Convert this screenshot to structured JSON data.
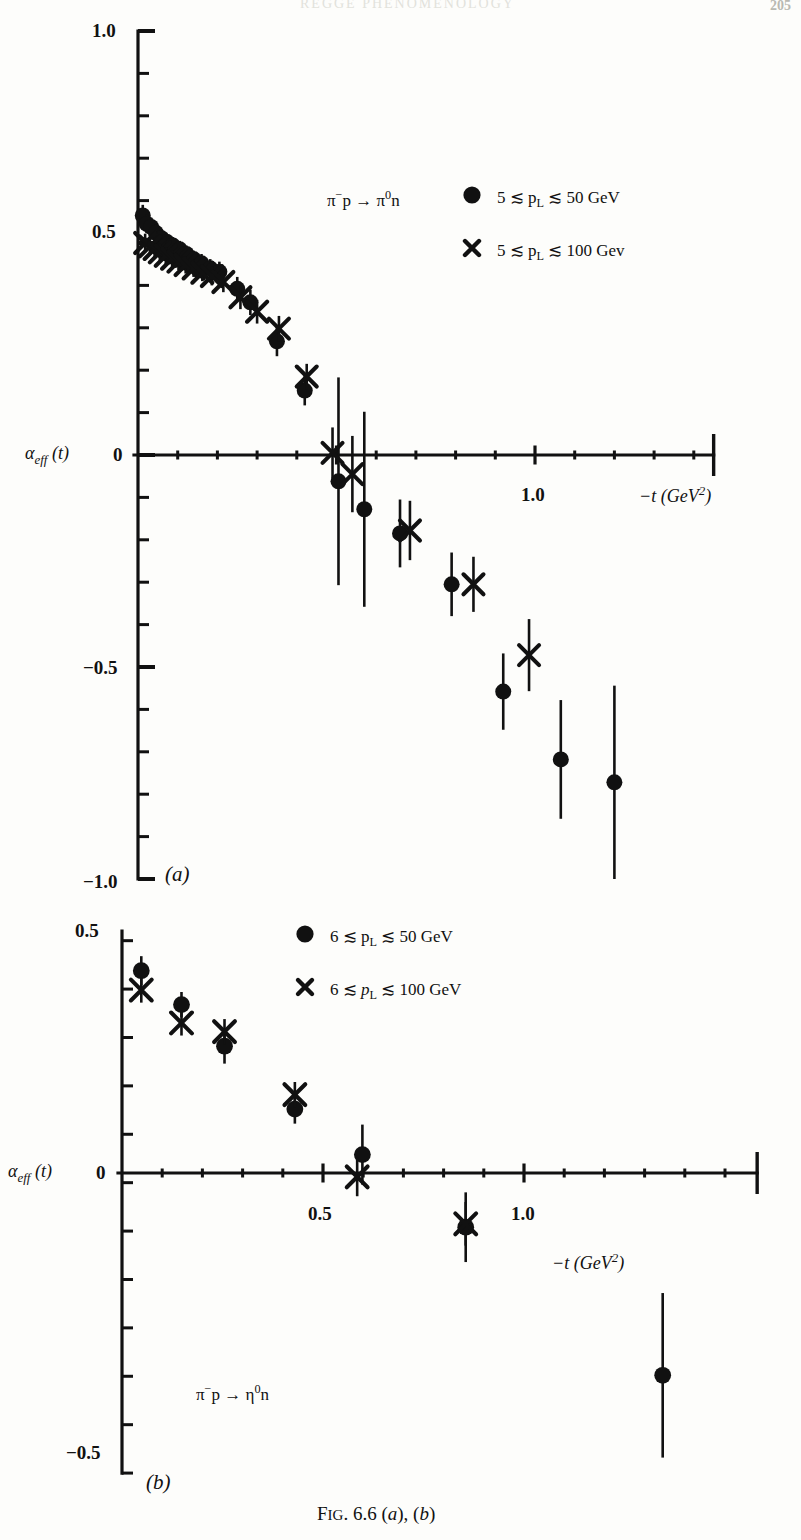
{
  "caption": "FIG. 6.6 (a), (b)",
  "axis_name_html": "&alpha;<sub><i>eff</i></sub> (<i>t</i>)",
  "xaxis_name_html": "&minus;<i>t</i> (GeV<sup>2</sup>)",
  "panel_a": {
    "id": "(a)",
    "reaction_html": "&pi;<sup>&minus;</sup>p &rarr; &pi;<sup>0</sup>n",
    "legend": [
      {
        "marker": "circle",
        "label_html": "5 &#8818; p<sub>L</sub> &#8818; 50 GeV"
      },
      {
        "marker": "cross",
        "label_html": "5 &#8818; p<sub>L</sub> &#8818; 100 Gev"
      }
    ],
    "ylabels": [
      "1.0",
      "0.5",
      "0",
      "-0.5",
      "-1.0"
    ],
    "xlabels": [
      "1.0"
    ]
  },
  "panel_b": {
    "id": "(b)",
    "reaction_html": "&pi;<sup>&minus;</sup>p &rarr; &eta;<sup>0</sup>n",
    "legend": [
      {
        "marker": "circle",
        "label_html": "6 &#8818; p<sub>L</sub> &#8818; 50 GeV"
      },
      {
        "marker": "cross",
        "label_html": "6 &#8818; <i>p</i><sub>L</sub> &#8818; 100 GeV"
      }
    ],
    "ylabels": [
      "0.5",
      "0",
      "-0.5"
    ],
    "xlabels": [
      "0.5",
      "1.0"
    ]
  },
  "chart_data": [
    {
      "type": "scatter",
      "panel": "(a)",
      "title": "pi- p -> pi0 n effective Regge trajectory",
      "xlabel": "-t (GeV^2)",
      "ylabel": "alpha_eff(t)",
      "xlim": [
        0.0,
        1.48
      ],
      "ylim": [
        -1.0,
        1.0
      ],
      "xticks_major": [
        0.5,
        1.0
      ],
      "xticks_major_labeled": [
        1.0
      ],
      "xtick_minor_step": 0.1,
      "yticks_major": [
        -1.0,
        -0.5,
        0.0,
        0.5,
        1.0
      ],
      "ytick_minor_step": 0.1,
      "grid": false,
      "legend_position": "upper-right",
      "series": [
        {
          "name": "5 <~ pL <~ 50 GeV",
          "marker": "filled-circle",
          "points": [
            {
              "x": 0.012,
              "y": 0.565,
              "yerr": 0.025
            },
            {
              "x": 0.022,
              "y": 0.545,
              "yerr": 0.022
            },
            {
              "x": 0.033,
              "y": 0.538,
              "yerr": 0.022
            },
            {
              "x": 0.045,
              "y": 0.524,
              "yerr": 0.02
            },
            {
              "x": 0.058,
              "y": 0.512,
              "yerr": 0.02
            },
            {
              "x": 0.072,
              "y": 0.503,
              "yerr": 0.02
            },
            {
              "x": 0.088,
              "y": 0.494,
              "yerr": 0.02
            },
            {
              "x": 0.105,
              "y": 0.485,
              "yerr": 0.02
            },
            {
              "x": 0.122,
              "y": 0.474,
              "yerr": 0.02
            },
            {
              "x": 0.14,
              "y": 0.462,
              "yerr": 0.02
            },
            {
              "x": 0.16,
              "y": 0.452,
              "yerr": 0.022
            },
            {
              "x": 0.182,
              "y": 0.44,
              "yerr": 0.022
            },
            {
              "x": 0.205,
              "y": 0.432,
              "yerr": 0.024
            },
            {
              "x": 0.25,
              "y": 0.392,
              "yerr": 0.028
            },
            {
              "x": 0.283,
              "y": 0.36,
              "yerr": 0.03
            },
            {
              "x": 0.35,
              "y": 0.268,
              "yerr": 0.035
            },
            {
              "x": 0.42,
              "y": 0.152,
              "yerr": 0.035
            },
            {
              "x": 0.505,
              "y": -0.062,
              "yerr": 0.245
            },
            {
              "x": 0.57,
              "y": -0.128,
              "yerr": 0.23
            },
            {
              "x": 0.66,
              "y": -0.185,
              "yerr": 0.08
            },
            {
              "x": 0.79,
              "y": -0.305,
              "yerr": 0.075
            },
            {
              "x": 0.92,
              "y": -0.558,
              "yerr": 0.09
            },
            {
              "x": 1.065,
              "y": -0.718,
              "yerr": 0.14
            },
            {
              "x": 1.2,
              "y": -0.772,
              "yerr": 0.228
            }
          ]
        },
        {
          "name": "5 <~ pL <~ 100 GeV",
          "marker": "cross",
          "points": [
            {
              "x": 0.018,
              "y": 0.5,
              "yerr": 0.022
            },
            {
              "x": 0.03,
              "y": 0.492,
              "yerr": 0.02
            },
            {
              "x": 0.042,
              "y": 0.486,
              "yerr": 0.02
            },
            {
              "x": 0.055,
              "y": 0.478,
              "yerr": 0.02
            },
            {
              "x": 0.07,
              "y": 0.47,
              "yerr": 0.02
            },
            {
              "x": 0.086,
              "y": 0.463,
              "yerr": 0.02
            },
            {
              "x": 0.102,
              "y": 0.456,
              "yerr": 0.02
            },
            {
              "x": 0.12,
              "y": 0.448,
              "yerr": 0.02
            },
            {
              "x": 0.14,
              "y": 0.44,
              "yerr": 0.02
            },
            {
              "x": 0.162,
              "y": 0.43,
              "yerr": 0.02
            },
            {
              "x": 0.186,
              "y": 0.422,
              "yerr": 0.022
            },
            {
              "x": 0.215,
              "y": 0.408,
              "yerr": 0.024
            },
            {
              "x": 0.258,
              "y": 0.372,
              "yerr": 0.028
            },
            {
              "x": 0.3,
              "y": 0.338,
              "yerr": 0.028
            },
            {
              "x": 0.355,
              "y": 0.298,
              "yerr": 0.03
            },
            {
              "x": 0.425,
              "y": 0.185,
              "yerr": 0.03
            },
            {
              "x": 0.49,
              "y": 0.005,
              "yerr": 0.06
            },
            {
              "x": 0.54,
              "y": -0.045,
              "yerr": 0.09
            },
            {
              "x": 0.685,
              "y": -0.178,
              "yerr": 0.07
            },
            {
              "x": 0.845,
              "y": -0.305,
              "yerr": 0.065
            },
            {
              "x": 0.985,
              "y": -0.472,
              "yerr": 0.085
            }
          ]
        }
      ]
    },
    {
      "type": "scatter",
      "panel": "(b)",
      "title": "pi- p -> eta0 n effective Regge trajectory",
      "xlabel": "-t (GeV^2)",
      "ylabel": "alpha_eff(t)",
      "xlim": [
        0.0,
        1.6
      ],
      "ylim": [
        -0.62,
        0.5
      ],
      "xticks_major": [
        0.5,
        1.0
      ],
      "xticks_major_labeled": [
        0.5,
        1.0
      ],
      "xtick_minor_step": 0.1,
      "yticks_major": [
        -0.5,
        0.0,
        0.5
      ],
      "ytick_minor_step": 0.1,
      "grid": false,
      "legend_position": "upper-right",
      "series": [
        {
          "name": "6 <~ pL <~ 50 GeV",
          "marker": "filled-circle",
          "points": [
            {
              "x": 0.048,
              "y": 0.418,
              "yerr": 0.03
            },
            {
              "x": 0.148,
              "y": 0.348,
              "yerr": 0.026
            },
            {
              "x": 0.255,
              "y": 0.262,
              "yerr": 0.036
            },
            {
              "x": 0.43,
              "y": 0.132,
              "yerr": 0.03
            },
            {
              "x": 0.598,
              "y": 0.038,
              "yerr": 0.062
            },
            {
              "x": 0.855,
              "y": -0.112,
              "yerr": 0.072
            },
            {
              "x": 1.345,
              "y": -0.418,
              "yerr": 0.17
            }
          ]
        },
        {
          "name": "6 <~ pL <~ 100 GeV",
          "marker": "cross",
          "points": [
            {
              "x": 0.048,
              "y": 0.378,
              "yerr": 0.026
            },
            {
              "x": 0.148,
              "y": 0.31,
              "yerr": 0.026
            },
            {
              "x": 0.255,
              "y": 0.292,
              "yerr": 0.026
            },
            {
              "x": 0.43,
              "y": 0.162,
              "yerr": 0.026
            },
            {
              "x": 0.585,
              "y": -0.008,
              "yerr": 0.04
            },
            {
              "x": 0.855,
              "y": -0.105,
              "yerr": 0.045
            }
          ]
        }
      ]
    }
  ]
}
